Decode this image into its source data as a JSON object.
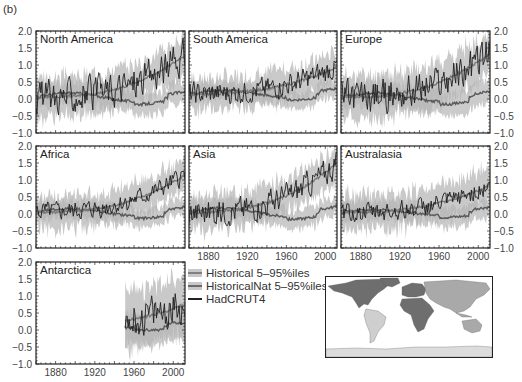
{
  "figure_label": "(b)",
  "legend": {
    "items": [
      {
        "label": "Historical 5–95%iles",
        "type": "band",
        "color": "#c0c0c0"
      },
      {
        "label": "HistoricalNat 5–95%iles",
        "type": "band",
        "color": "#a8a8a8"
      },
      {
        "label": "HadCRUT4",
        "type": "line",
        "color": "#222222"
      }
    ]
  },
  "colors": {
    "historical_band": "#c9c9c9",
    "historical_line": "#7a7a7a",
    "natural_band": "#b5b5b5",
    "natural_line": "#5a5a5a",
    "observed": "#1e1e1e",
    "map_north_america": "#6e6e6e",
    "map_south_america": "#cfcfcf",
    "map_europe": "#6e6e6e",
    "map_africa": "#6e6e6e",
    "map_asia": "#a9a9a9",
    "map_australasia": "#a9a9a9",
    "map_antarctica": "#dcdcdc"
  },
  "axes": {
    "y_ticks": [
      "2.0",
      "1.5",
      "1.0",
      "0.5",
      "0.0",
      "−0.5",
      "−1.0"
    ],
    "x_ticks": [
      "1880",
      "1920",
      "1960",
      "2000"
    ],
    "ylim": [
      -1.0,
      2.0
    ],
    "xlim": [
      1860,
      2012
    ]
  },
  "chart_data": {
    "type": "line",
    "xlabel": "Year",
    "ylabel": "Temperature anomaly (°C)",
    "ylim": [
      -1.0,
      2.0
    ],
    "xlim": [
      1860,
      2012
    ],
    "x_tick_labels": [
      "1880",
      "1920",
      "1960",
      "2000"
    ],
    "y_tick_labels": [
      "-1.0",
      "-0.5",
      "0.0",
      "0.5",
      "1.0",
      "1.5",
      "2.0"
    ],
    "legend": [
      "Historical 5–95%iles",
      "HistoricalNat 5–95%iles",
      "HadCRUT4"
    ],
    "legend_position": "below-center",
    "grid": false,
    "x": [
      1860,
      1880,
      1900,
      1920,
      1940,
      1960,
      1980,
      2000,
      2010
    ],
    "panels": [
      {
        "name": "North America",
        "series": [
          {
            "name": "HadCRUT4",
            "values": [
              0.1,
              0.0,
              0.1,
              0.2,
              0.5,
              0.3,
              0.4,
              1.0,
              1.3
            ]
          },
          {
            "name": "Historical mean",
            "values": [
              0.1,
              0.1,
              0.15,
              0.2,
              0.3,
              0.3,
              0.5,
              0.9,
              1.1
            ]
          },
          {
            "name": "HistoricalNat mean",
            "values": [
              0.1,
              0.05,
              0.1,
              0.2,
              0.25,
              0.2,
              0.05,
              0.2,
              0.3
            ]
          }
        ]
      },
      {
        "name": "South America",
        "series": [
          {
            "name": "HadCRUT4",
            "values": [
              0.3,
              0.0,
              0.1,
              0.2,
              0.3,
              0.3,
              0.4,
              0.7,
              0.9
            ]
          },
          {
            "name": "Historical mean",
            "values": [
              0.2,
              0.15,
              0.2,
              0.25,
              0.3,
              0.35,
              0.5,
              0.8,
              1.0
            ]
          },
          {
            "name": "HistoricalNat mean",
            "values": [
              0.2,
              0.1,
              0.15,
              0.2,
              0.25,
              0.15,
              0.1,
              0.2,
              0.25
            ]
          }
        ]
      },
      {
        "name": "Europe",
        "series": [
          {
            "name": "HadCRUT4",
            "values": [
              0.1,
              -0.2,
              0.0,
              0.2,
              0.5,
              0.3,
              0.3,
              1.0,
              1.4
            ]
          },
          {
            "name": "Historical mean",
            "values": [
              0.15,
              0.1,
              0.15,
              0.2,
              0.3,
              0.3,
              0.4,
              0.9,
              1.2
            ]
          },
          {
            "name": "HistoricalNat mean",
            "values": [
              0.15,
              0.1,
              0.15,
              0.2,
              0.2,
              0.15,
              0.0,
              0.25,
              0.3
            ]
          }
        ]
      },
      {
        "name": "Africa",
        "series": [
          {
            "name": "HadCRUT4",
            "values": [
              0.0,
              -0.3,
              0.0,
              0.1,
              0.25,
              0.2,
              0.3,
              0.8,
              1.1
            ]
          },
          {
            "name": "Historical mean",
            "values": [
              0.1,
              0.1,
              0.15,
              0.2,
              0.3,
              0.3,
              0.5,
              0.9,
              1.2
            ]
          },
          {
            "name": "HistoricalNat mean",
            "values": [
              0.1,
              0.05,
              0.1,
              0.15,
              0.2,
              0.15,
              0.0,
              0.2,
              0.25
            ]
          }
        ]
      },
      {
        "name": "Asia",
        "series": [
          {
            "name": "HadCRUT4",
            "values": [
              0.1,
              -0.2,
              0.0,
              0.15,
              0.4,
              0.3,
              0.5,
              1.2,
              1.5
            ]
          },
          {
            "name": "Historical mean",
            "values": [
              0.1,
              0.1,
              0.15,
              0.2,
              0.3,
              0.3,
              0.5,
              1.1,
              1.5
            ]
          },
          {
            "name": "HistoricalNat mean",
            "values": [
              0.1,
              0.05,
              0.1,
              0.15,
              0.2,
              0.15,
              0.0,
              0.2,
              0.3
            ]
          }
        ]
      },
      {
        "name": "Australasia",
        "series": [
          {
            "name": "HadCRUT4",
            "values": [
              0.0,
              -0.1,
              0.1,
              0.1,
              0.2,
              0.2,
              0.35,
              0.6,
              0.9
            ]
          },
          {
            "name": "Historical mean",
            "values": [
              0.1,
              0.1,
              0.1,
              0.15,
              0.25,
              0.3,
              0.35,
              0.6,
              0.8
            ]
          },
          {
            "name": "HistoricalNat mean",
            "values": [
              0.1,
              0.05,
              0.1,
              0.1,
              0.15,
              0.1,
              0.0,
              0.15,
              0.2
            ]
          }
        ]
      },
      {
        "name": "Antarctica",
        "data_start": 1950,
        "series": [
          {
            "name": "HadCRUT4",
            "values": [
              null,
              null,
              null,
              null,
              null,
              0.2,
              0.3,
              0.5,
              0.7
            ]
          },
          {
            "name": "Historical mean",
            "values": [
              null,
              null,
              null,
              null,
              null,
              0.1,
              0.3,
              0.55,
              0.75
            ]
          },
          {
            "name": "HistoricalNat mean",
            "values": [
              null,
              null,
              null,
              null,
              null,
              0.0,
              0.0,
              0.1,
              0.1
            ]
          }
        ]
      }
    ]
  },
  "panels": [
    {
      "name": "North America",
      "col": 0,
      "row": 0,
      "left_axis": true,
      "right_axis": false,
      "bottom_axis": false,
      "seed": 3,
      "trend": [
        0.05,
        1.3
      ],
      "nat": 0.25,
      "spread": 0.55,
      "noise": 0.45,
      "start": 1860
    },
    {
      "name": "South America",
      "col": 1,
      "row": 0,
      "left_axis": false,
      "right_axis": false,
      "bottom_axis": false,
      "seed": 7,
      "trend": [
        0.15,
        0.95
      ],
      "nat": 0.2,
      "spread": 0.45,
      "noise": 0.3,
      "start": 1860
    },
    {
      "name": "Europe",
      "col": 2,
      "row": 0,
      "left_axis": false,
      "right_axis": true,
      "bottom_axis": false,
      "seed": 11,
      "trend": [
        0.05,
        1.35
      ],
      "nat": 0.25,
      "spread": 0.6,
      "noise": 0.45,
      "start": 1860
    },
    {
      "name": "Africa",
      "col": 0,
      "row": 1,
      "left_axis": true,
      "right_axis": false,
      "bottom_axis": false,
      "seed": 13,
      "trend": [
        0.05,
        1.15
      ],
      "nat": 0.2,
      "spread": 0.45,
      "noise": 0.25,
      "start": 1860
    },
    {
      "name": "Asia",
      "col": 1,
      "row": 1,
      "left_axis": false,
      "right_axis": false,
      "bottom_axis": true,
      "seed": 17,
      "trend": [
        0.05,
        1.5
      ],
      "nat": 0.25,
      "spread": 0.5,
      "noise": 0.35,
      "start": 1860
    },
    {
      "name": "Australasia",
      "col": 2,
      "row": 1,
      "left_axis": false,
      "right_axis": true,
      "bottom_axis": true,
      "seed": 19,
      "trend": [
        0.05,
        0.85
      ],
      "nat": 0.15,
      "spread": 0.5,
      "noise": 0.25,
      "start": 1860
    },
    {
      "name": "Antarctica",
      "col": 0,
      "row": 2,
      "left_axis": true,
      "right_axis": false,
      "bottom_axis": true,
      "seed": 23,
      "trend": [
        0.1,
        0.75
      ],
      "nat": 0.05,
      "spread": 0.8,
      "noise": 0.5,
      "start": 1951
    }
  ],
  "map": {
    "label": "Region map",
    "regions": [
      "North America",
      "South America",
      "Europe",
      "Africa",
      "Asia",
      "Australasia",
      "Antarctica"
    ]
  }
}
